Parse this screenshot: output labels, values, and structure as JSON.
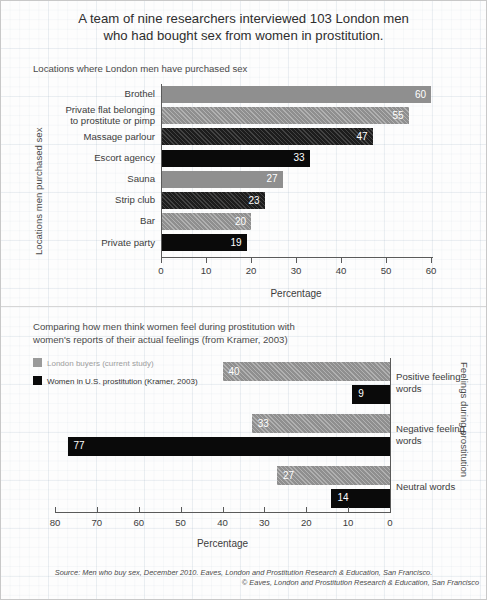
{
  "title": {
    "line1": "A team of nine researchers interviewed 103 London men",
    "line2": "who had bought sex from women in prostitution."
  },
  "chart_data": [
    {
      "type": "bar",
      "orientation": "horizontal",
      "title": "Locations where London men have purchased sex",
      "xlabel": "Percentage",
      "ylabel": "Locations men purchased sex",
      "xlim": [
        0,
        60
      ],
      "xticks": [
        "0",
        "10",
        "20",
        "30",
        "40",
        "50",
        "60"
      ],
      "grid": false,
      "categories": [
        "Brothel",
        "Private flat belonging to prostitute or pimp",
        "Massage parlour",
        "Escort agency",
        "Sauna",
        "Strip club",
        "Bar",
        "Private party"
      ],
      "category_lines": [
        [
          "Brothel"
        ],
        [
          "Private flat belonging",
          "to prostitute or pimp"
        ],
        [
          "Massage parlour"
        ],
        [
          "Escort agency"
        ],
        [
          "Sauna"
        ],
        [
          "Strip club"
        ],
        [
          "Bar"
        ],
        [
          "Private party"
        ]
      ],
      "values": [
        60,
        55,
        47,
        33,
        27,
        23,
        20,
        19
      ],
      "styles": [
        "v-solid",
        "v-hatch",
        "d-hatch",
        "d-solid",
        "v-solid",
        "d-hatch",
        "v-hatch",
        "d-solid"
      ]
    },
    {
      "type": "bar",
      "orientation": "horizontal-reversed",
      "title_lines": [
        "Comparing how men think women feel during prostitution with",
        "women's reports of their actual feelings (from Kramer, 2003)"
      ],
      "xlabel": "Percentage",
      "ylabel": "Feelings during prostitution",
      "xlim": [
        0,
        80
      ],
      "xticks": [
        "80",
        "70",
        "60",
        "50",
        "40",
        "30",
        "20",
        "10",
        "0"
      ],
      "grid": false,
      "categories": [
        "Positive feeling words",
        "Negative feeling words",
        "Neutral words"
      ],
      "category_lines": [
        [
          "Positive feeling",
          "words"
        ],
        [
          "Negative feeling",
          "words"
        ],
        [
          "Neutral words"
        ]
      ],
      "series": [
        {
          "name": "London buyers (current study)",
          "values": [
            40,
            33,
            27
          ],
          "style": "v-hatch"
        },
        {
          "name": "Women in U.S. prostitution (Kramer, 2003)",
          "values": [
            9,
            77,
            14
          ],
          "style": "d-solid"
        }
      ],
      "legend": [
        {
          "label": "London buyers (current study)",
          "swatch": "sw-grey",
          "text_class": "lg-grey-txt"
        },
        {
          "label": "Women in U.S. prostitution (Kramer, 2003)",
          "swatch": "sw-black",
          "text_class": "lg-black-txt"
        }
      ]
    }
  ],
  "footer": {
    "line1": "Source: Men who buy sex, December 2010. Eaves, London and Prostitution Research & Education, San Francisco.",
    "line2": "© Eaves, London and Prostitution Research & Education, San Francisco"
  },
  "colors": {
    "grey_bar": "#8f8f8f",
    "black_bar": "#0a0a0a",
    "axis": "#5a5a5a",
    "text": "#3a3a3a"
  }
}
